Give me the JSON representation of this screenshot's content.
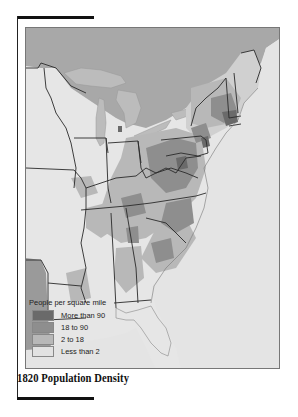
{
  "map": {
    "caption": "1820 Population Density",
    "region": "Eastern United States",
    "colors": {
      "water": "#a8a8a8",
      "ocean": "#e4e4e4",
      "land_base": "#e6e6e6",
      "border": "#2a2a2a"
    }
  },
  "legend": {
    "title": "People per square mile",
    "items": [
      {
        "label": "More than 90",
        "color": "#6a6a6a"
      },
      {
        "label": "18 to 90",
        "color": "#8e8e8e"
      },
      {
        "label": "2 to 18",
        "color": "#b8b8b8"
      },
      {
        "label": "Less than 2",
        "color": "#e2e2e2"
      }
    ]
  }
}
